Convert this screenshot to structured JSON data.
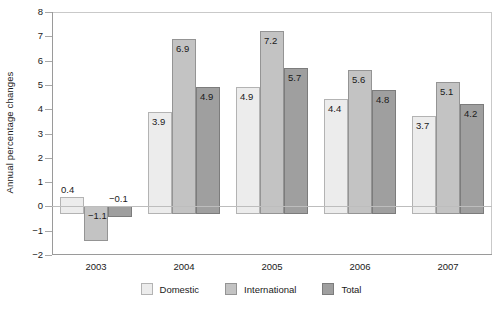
{
  "chart_data": {
    "type": "bar",
    "title": "",
    "subtitle": "",
    "xlabel": "",
    "ylabel": "Annual percentage changes",
    "categories": [
      "2003",
      "2004",
      "2005",
      "2006",
      "2007"
    ],
    "series": [
      {
        "name": "Domestic",
        "color": "#ececec",
        "values": [
          0.4,
          3.9,
          4.9,
          4.4,
          3.7
        ]
      },
      {
        "name": "International",
        "color": "#c3c3c3",
        "values": [
          -1.1,
          6.9,
          7.2,
          5.6,
          5.1
        ]
      },
      {
        "name": "Total",
        "color": "#9f9f9f",
        "values": [
          -0.1,
          4.9,
          5.7,
          4.8,
          4.2
        ]
      }
    ],
    "data_labels": [
      "0.4",
      "3.9",
      "4.9",
      "4.4",
      "3.7",
      "−1.1",
      "6.9",
      "7.2",
      "5.6",
      "5.1",
      "−0.1",
      "4.9",
      "5.7",
      "4.8",
      "4.2"
    ],
    "ylim": [
      -2,
      8
    ],
    "yticks": [
      8,
      7,
      6,
      5,
      4,
      3,
      2,
      1,
      0,
      -1,
      -2
    ],
    "ytick_labels": [
      "8",
      "7",
      "6",
      "5",
      "4",
      "3",
      "2",
      "1",
      "0",
      "−1",
      "−2"
    ],
    "grid": false,
    "legend_position": "bottom",
    "legend": [
      "Domestic",
      "International",
      "Total"
    ]
  }
}
